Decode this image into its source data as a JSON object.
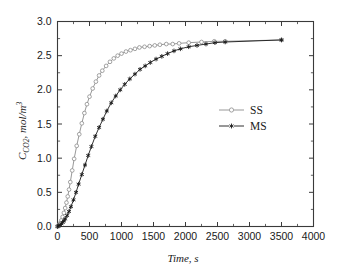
{
  "figure": {
    "background_color": "#ffffff",
    "frame_color": "#3a3a3a"
  },
  "chart_data": {
    "type": "line",
    "title": "",
    "subtitle": "",
    "xlabel": "Time, s",
    "ylabel": "C_CO2, mol/m3",
    "ylabel_parts": {
      "main": "C",
      "sub": "CO2",
      "rest": ", mol/m",
      "sup": "3"
    },
    "xlim": [
      0,
      4000
    ],
    "ylim": [
      0.0,
      3.0
    ],
    "xticks": [
      0,
      500,
      1000,
      1500,
      2000,
      2500,
      3000,
      3500,
      4000
    ],
    "xtick_labels": [
      "0",
      "500",
      "1000",
      "1500",
      "2000",
      "2500",
      "3000",
      "3500",
      "4000"
    ],
    "yticks": [
      0.0,
      0.5,
      1.0,
      1.5,
      2.0,
      2.5,
      3.0
    ],
    "ytick_labels": [
      "0.0",
      "0.5",
      "1.0",
      "1.5",
      "2.0",
      "2.5",
      "3.0"
    ],
    "minor_ticks_per_interval": 1,
    "grid": false,
    "legend_position": "center-right",
    "series": [
      {
        "name": "SS",
        "color": "#8c8c8c",
        "marker": "open-circle",
        "marker_size": 3.0,
        "line_width": 0.9,
        "x": [
          0,
          20,
          40,
          60,
          80,
          100,
          120,
          140,
          160,
          180,
          200,
          230,
          260,
          300,
          340,
          380,
          420,
          460,
          500,
          550,
          600,
          650,
          700,
          760,
          820,
          880,
          940,
          1000,
          1070,
          1140,
          1210,
          1280,
          1360,
          1440,
          1520,
          1600,
          1700,
          1800,
          1900,
          2050,
          2250,
          2450,
          2620,
          3500
        ],
        "y": [
          0.0,
          0.02,
          0.05,
          0.09,
          0.14,
          0.2,
          0.27,
          0.35,
          0.44,
          0.54,
          0.65,
          0.82,
          0.99,
          1.18,
          1.35,
          1.51,
          1.66,
          1.79,
          1.9,
          2.02,
          2.12,
          2.21,
          2.28,
          2.35,
          2.41,
          2.46,
          2.5,
          2.53,
          2.56,
          2.58,
          2.6,
          2.62,
          2.63,
          2.64,
          2.65,
          2.66,
          2.67,
          2.67,
          2.68,
          2.69,
          2.7,
          2.71,
          2.71,
          2.73
        ]
      },
      {
        "name": "MS",
        "color": "#1a1a1a",
        "marker": "star",
        "marker_size": 3.2,
        "line_width": 0.9,
        "x": [
          0,
          20,
          40,
          60,
          80,
          100,
          120,
          150,
          180,
          210,
          250,
          290,
          330,
          380,
          430,
          480,
          530,
          590,
          650,
          710,
          770,
          840,
          910,
          980,
          1050,
          1130,
          1210,
          1290,
          1370,
          1450,
          1540,
          1630,
          1720,
          1820,
          1920,
          2050,
          2180,
          2320,
          2460,
          2620,
          3500
        ],
        "y": [
          0.0,
          0.01,
          0.02,
          0.04,
          0.06,
          0.08,
          0.11,
          0.16,
          0.22,
          0.29,
          0.39,
          0.5,
          0.62,
          0.76,
          0.9,
          1.04,
          1.17,
          1.32,
          1.45,
          1.57,
          1.69,
          1.81,
          1.91,
          2.0,
          2.08,
          2.16,
          2.23,
          2.3,
          2.35,
          2.4,
          2.45,
          2.49,
          2.53,
          2.57,
          2.6,
          2.63,
          2.65,
          2.67,
          2.69,
          2.7,
          2.73
        ]
      }
    ],
    "legend": [
      {
        "label": "SS",
        "color": "#8c8c8c",
        "marker": "open-circle"
      },
      {
        "label": "MS",
        "color": "#1a1a1a",
        "marker": "star"
      }
    ]
  }
}
